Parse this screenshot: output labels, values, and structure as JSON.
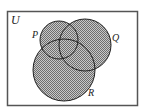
{
  "diagram": {
    "type": "venn",
    "universe_label": "U",
    "sets": [
      {
        "name": "P",
        "label": "P"
      },
      {
        "name": "Q",
        "label": "Q"
      },
      {
        "name": "R",
        "label": "R"
      }
    ],
    "shading": "all of P ∪ Q ∪ R shaded",
    "colors": {
      "frame": "#555555",
      "shade_dark": "#6e6e6e",
      "shade_light": "#c8c8c8",
      "outline": "#222222",
      "background": "#ffffff"
    }
  }
}
